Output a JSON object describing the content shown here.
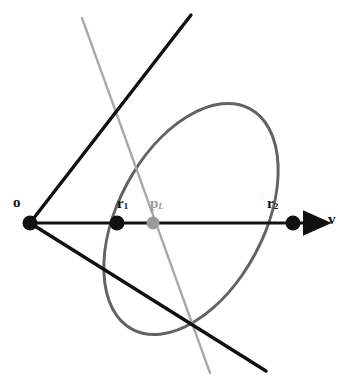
{
  "figure": {
    "width": 364,
    "height": 390,
    "background_color": "#ffffff"
  },
  "labels": {
    "origin": "o",
    "near_intersection": "r",
    "near_intersection_sub": "1",
    "projected_point": "p",
    "projected_point_sub": "L",
    "far_intersection": "r",
    "far_intersection_sub": "2",
    "direction_vector": "v"
  },
  "colors": {
    "black": "#111111",
    "ellipse_gray": "#636363",
    "light_gray": "#a8a8a8",
    "point_gray": "#9a9a9a",
    "background": "#ffffff"
  },
  "points": [
    {
      "name": "o",
      "x": 30,
      "y": 223,
      "radius": 7.5,
      "color": "#111111",
      "label_dx": -17,
      "label_dy": -28
    },
    {
      "name": "r1",
      "x": 117,
      "y": 223,
      "radius": 7.5,
      "color": "#111111",
      "label_dx": 0,
      "label_dy": -27
    },
    {
      "name": "pL",
      "x": 153,
      "y": 223,
      "radius": 6.5,
      "color": "#9a9a9a",
      "label_dx": -3,
      "label_dy": -27
    },
    {
      "name": "r2",
      "x": 293,
      "y": 223,
      "radius": 7.5,
      "color": "#111111",
      "label_dx": -26,
      "label_dy": -27
    }
  ],
  "geometry": {
    "axis_line": {
      "x1": 30,
      "y1": 223,
      "x2": 312,
      "y2": 223,
      "stroke_width": 3.2,
      "arrow": true
    },
    "upper_ray": {
      "x1": 30,
      "y1": 223,
      "x2": 191,
      "y2": 15,
      "stroke_width": 3.4
    },
    "lower_ray": {
      "x1": 30,
      "y1": 223,
      "x2": 266,
      "y2": 371,
      "stroke_width": 3.4
    },
    "plane_line": {
      "x1": 82,
      "y1": 18,
      "x2": 210,
      "y2": 373,
      "stroke_width": 2.3
    },
    "ellipse": {
      "cx": 191,
      "cy": 219,
      "rx": 73,
      "ry": 125,
      "rotation_deg": 28,
      "stroke_width": 3.0
    }
  }
}
